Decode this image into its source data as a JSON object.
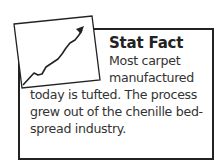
{
  "sidebar_box": {
    "icon": "rising-chart-icon",
    "title": "Stat Fact",
    "lines": [
      "Most carpet",
      "manufactured",
      "today is tufted. The process",
      "grew out of the chenille bed-",
      "spread industry."
    ]
  }
}
